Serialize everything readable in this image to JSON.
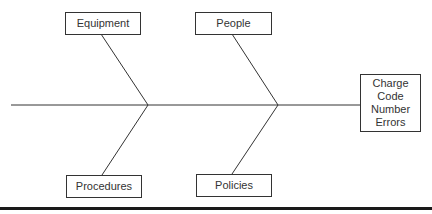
{
  "diagram": {
    "type": "fishbone",
    "effect": {
      "lines": [
        "Charge",
        "Code",
        "Number",
        "Errors"
      ]
    },
    "causes": {
      "top_left": "Equipment",
      "top_right": "People",
      "bottom_left": "Procedures",
      "bottom_right": "Policies"
    },
    "colors": {
      "line": "#333333",
      "box_border": "#333333",
      "text": "#333333",
      "rule": "#1a1a1a"
    }
  }
}
